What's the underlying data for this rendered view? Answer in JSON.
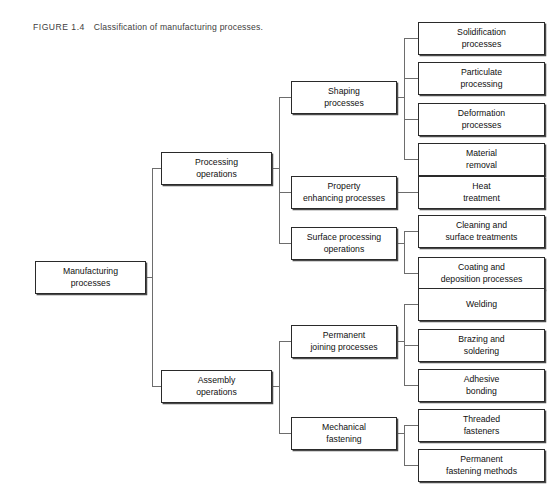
{
  "figure": {
    "label": "FIGURE 1.4",
    "text": "Classification of manufacturing processes."
  },
  "colors": {
    "box_border": "#2a2a2a",
    "connector": "#6d6d6d",
    "background": "#ffffff",
    "text": "#101010"
  },
  "diagram": {
    "type": "tree",
    "root": "Manufacturing processes",
    "nodes": {
      "root": {
        "label_line1": "Manufacturing",
        "label_line2": "processes"
      },
      "processing_operations": {
        "label_line1": "Processing",
        "label_line2": "operations"
      },
      "assembly_operations": {
        "label_line1": "Assembly",
        "label_line2": "operations"
      },
      "shaping_processes": {
        "label_line1": "Shaping",
        "label_line2": "processes"
      },
      "property_enhancing": {
        "label_line1": "Property",
        "label_line2": "enhancing processes"
      },
      "surface_processing": {
        "label_line1": "Surface processing",
        "label_line2": "operations"
      },
      "permanent_joining": {
        "label_line1": "Permanent",
        "label_line2": "joining processes"
      },
      "mechanical_fastening": {
        "label_line1": "Mechanical",
        "label_line2": "fastening"
      },
      "solidification": {
        "label_line1": "Solidification",
        "label_line2": "processes"
      },
      "particulate": {
        "label_line1": "Particulate",
        "label_line2": "processing"
      },
      "deformation": {
        "label_line1": "Deformation",
        "label_line2": "processes"
      },
      "material_removal": {
        "label_line1": "Material",
        "label_line2": "removal"
      },
      "heat_treatment": {
        "label_line1": "Heat",
        "label_line2": "treatment"
      },
      "cleaning_surface": {
        "label_line1": "Cleaning and",
        "label_line2": "surface treatments"
      },
      "coating_deposition": {
        "label_line1": "Coating and",
        "label_line2": "deposition processes"
      },
      "welding": {
        "label_line1": "Welding",
        "label_line2": ""
      },
      "brazing_soldering": {
        "label_line1": "Brazing and",
        "label_line2": "soldering"
      },
      "adhesive_bonding": {
        "label_line1": "Adhesive",
        "label_line2": "bonding"
      },
      "threaded_fasteners": {
        "label_line1": "Threaded",
        "label_line2": "fasteners"
      },
      "permanent_fastening": {
        "label_line1": "Permanent",
        "label_line2": "fastening methods"
      }
    }
  }
}
